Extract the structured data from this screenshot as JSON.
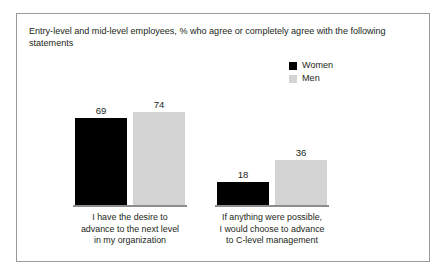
{
  "figure": {
    "title": "Entry-level and mid-level employees, % who agree or completely agree with the following statements"
  },
  "legend": {
    "position": "top-right",
    "entries": [
      {
        "label": "Women",
        "color": "#000000"
      },
      {
        "label": "Men",
        "color": "#d4d4d4"
      }
    ]
  },
  "chart_data": {
    "type": "bar",
    "title": "Entry-level and mid-level employees, % who agree or completely agree with the following statements",
    "xlabel": "",
    "ylabel": "",
    "ylim": [
      0,
      100
    ],
    "grid": false,
    "legend_position": "top-right",
    "categories": [
      "I have the desire to advance to the next level in my organization",
      "If anything were possible, I would choose to advance to C-level management"
    ],
    "category_lines": [
      [
        "I have the desire to",
        "advance to the next level",
        "in my organization"
      ],
      [
        "If anything were possible,",
        "I would choose to advance",
        "to C-level management"
      ]
    ],
    "series": [
      {
        "name": "Women",
        "color": "#000000",
        "values": [
          69,
          18
        ]
      },
      {
        "name": "Men",
        "color": "#d4d4d4",
        "values": [
          74,
          36
        ]
      }
    ]
  }
}
